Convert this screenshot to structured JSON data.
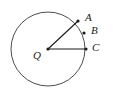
{
  "figure": {
    "background_color": "#ffffff",
    "stroke_color": "#4d4d4d",
    "line_color": "#1a1a1a",
    "point_color": "#1a1a1a",
    "label_color": "#1a1a1a",
    "width": 113,
    "height": 103
  },
  "circle": {
    "name": "circle-Q",
    "center_x": 48,
    "center_y": 49,
    "radius": 37,
    "stroke_width": 1
  },
  "points": [
    {
      "id": "Q",
      "label": "Q",
      "x": 48,
      "y": 49,
      "role": "center"
    },
    {
      "id": "A",
      "label": "A",
      "x": 78,
      "y": 21,
      "role": "on-circle"
    },
    {
      "id": "B",
      "label": "B",
      "x": 84,
      "y": 33,
      "role": "on-circle"
    },
    {
      "id": "C",
      "label": "C",
      "x": 86,
      "y": 49,
      "role": "on-circle"
    }
  ],
  "segments": [
    {
      "id": "QA",
      "from": "Q",
      "to": "A",
      "x1": 48,
      "y1": 49,
      "x2": 78,
      "y2": 21
    },
    {
      "id": "QC",
      "from": "Q",
      "to": "C",
      "x1": 48,
      "y1": 49,
      "x2": 86,
      "y2": 49
    }
  ],
  "labels": {
    "A": "A",
    "B": "B",
    "C": "C",
    "Q": "Q"
  }
}
